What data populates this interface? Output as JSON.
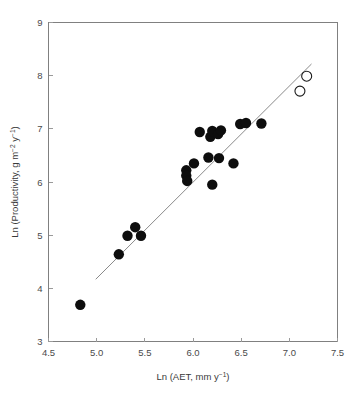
{
  "chart_data": {
    "type": "scatter",
    "title": "",
    "xlabel": "Ln (AET, mm y⁻¹)",
    "ylabel": "Ln (Productivity, g m⁻² y⁻¹)",
    "xlabel_parts": {
      "base": "Ln (AET, mm y",
      "sup": "−1",
      "tail": ")"
    },
    "ylabel_parts": {
      "base": "Ln (Productivity, g m",
      "sup1": "−2",
      "mid": " y",
      "sup2": "−1",
      "tail": ")"
    },
    "xlim": [
      4.5,
      7.5
    ],
    "ylim": [
      3,
      9
    ],
    "xticks": [
      4.5,
      5.0,
      5.5,
      6.0,
      6.5,
      7.0,
      7.5
    ],
    "xtick_labels": [
      "4.5",
      "5.0",
      "5.5",
      "6.0",
      "6.5",
      "7.0",
      "7.5"
    ],
    "yticks": [
      3,
      4,
      5,
      6,
      7,
      8,
      9
    ],
    "ytick_labels": [
      "3",
      "4",
      "5",
      "6",
      "7",
      "8",
      "9"
    ],
    "grid": false,
    "legend": "none",
    "series": [
      {
        "name": "observations",
        "marker": "filled-circle",
        "color": "#0d0d0d",
        "points": [
          [
            4.83,
            3.69
          ],
          [
            5.23,
            4.64
          ],
          [
            5.32,
            4.99
          ],
          [
            5.4,
            5.15
          ],
          [
            5.46,
            4.99
          ],
          [
            5.93,
            6.22
          ],
          [
            5.93,
            6.12
          ],
          [
            5.94,
            6.02
          ],
          [
            6.01,
            6.35
          ],
          [
            6.07,
            6.94
          ],
          [
            6.16,
            6.46
          ],
          [
            6.18,
            6.85
          ],
          [
            6.2,
            6.96
          ],
          [
            6.2,
            5.95
          ],
          [
            6.26,
            6.9
          ],
          [
            6.27,
            6.45
          ],
          [
            6.29,
            6.97
          ],
          [
            6.42,
            6.35
          ],
          [
            6.49,
            7.09
          ],
          [
            6.55,
            7.11
          ],
          [
            6.71,
            7.1
          ]
        ]
      },
      {
        "name": "excluded-outliers",
        "marker": "open-circle",
        "color": "#ffffff",
        "points": [
          [
            7.18,
            7.99
          ],
          [
            7.11,
            7.71
          ]
        ]
      }
    ],
    "fit_line": {
      "name": "regression-line",
      "color": "#8a8a8a",
      "x_start": 4.99,
      "y_start": 4.17,
      "x_end": 7.23,
      "y_end": 8.22
    }
  }
}
